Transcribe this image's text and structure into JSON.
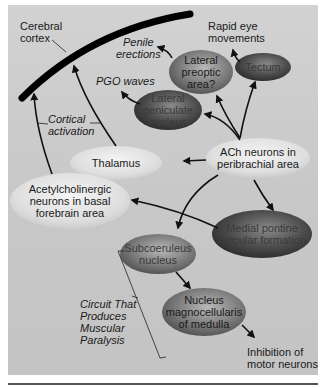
{
  "diagram": {
    "structures": {
      "cerebral_cortex": "Cerebral cortex",
      "cerebral_cortex_l1": "Cerebral",
      "cerebral_cortex_l2": "cortex"
    },
    "nodes": {
      "lateral_preoptic": {
        "l1": "Lateral",
        "l2": "preoptic",
        "l3": "area?"
      },
      "tectum": {
        "l1": "Tectum"
      },
      "lateral_geniculate": {
        "l1": "Lateral",
        "l2": "geniculate",
        "l3": "nucleus"
      },
      "thalamus": {
        "l1": "Thalamus"
      },
      "ach_peribrachial": {
        "l1": "ACh neurons in",
        "l2": "peribrachial area"
      },
      "basal_forebrain": {
        "l1": "Acetylcholinergic",
        "l2": "neurons in basal",
        "l3": "forebrain area"
      },
      "medial_pontine": {
        "l1": "Medial pontine",
        "l2": "reticular formation"
      },
      "subcoeruleus": {
        "l1": "Subcoeruleus",
        "l2": "nucleus"
      },
      "magnocellularis": {
        "l1": "Nucleus",
        "l2": "magnocellularis",
        "l3": "of medulla"
      }
    },
    "outcomes": {
      "rapid_eye_l1": "Rapid eye",
      "rapid_eye_l2": "movements",
      "penile_l1": "Penile",
      "penile_l2": "erections",
      "pgo": "PGO waves",
      "cortical_l1": "Cortical",
      "cortical_l2": "activation",
      "inhibition_l1": "Inhibition of",
      "inhibition_l2": "motor neurons"
    },
    "circuit_label": {
      "l1": "Circuit That",
      "l2": "Produces",
      "l3": "Muscular",
      "l4": "Paralysis"
    },
    "colors": {
      "panel": "#cccccc",
      "dark_node": "#4a4a4a",
      "mid_node": "#8a8a8a",
      "light_node": "#e6e6e6",
      "arrow": "#111111"
    }
  }
}
